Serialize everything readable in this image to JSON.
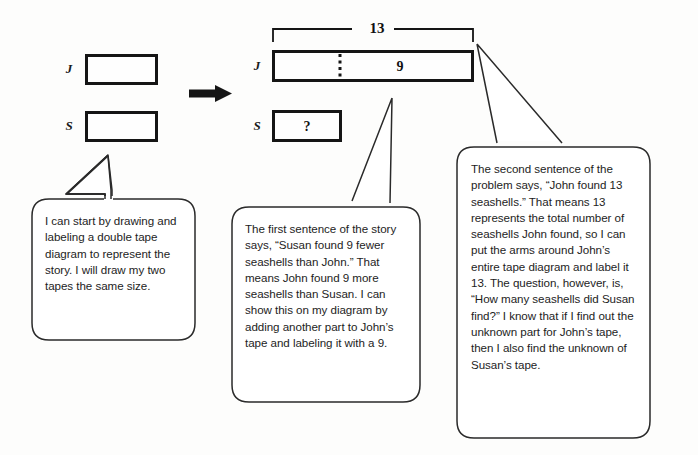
{
  "diagram": {
    "left_model": {
      "label_j": "J",
      "label_s": "S",
      "j_value": "",
      "s_value": ""
    },
    "transition_arrow": "arrow-right",
    "right_model": {
      "label_j": "J",
      "label_s": "S",
      "bracket_total": "13",
      "j_part_value": "9",
      "s_value": "?"
    },
    "bubbles": [
      {
        "id": "bubble-drawing-tapes",
        "text": "I can start by drawing and labeling a double tape diagram to represent the story.  I will draw my two tapes the same size."
      },
      {
        "id": "bubble-first-sentence",
        "text": "The first sentence of the story says, “Susan found 9 fewer seashells than John.”  That means John found 9 more seashells than Susan.  I can show this on my diagram by adding another part to John’s tape and labeling it with a 9."
      },
      {
        "id": "bubble-second-sentence",
        "text": "The second sentence of the problem says, “John found 13 seashells.”  That means 13 represents the total number of seashells John found, so I can put the arms around John’s entire tape diagram and label it 13.  The question, however, is, “How many seashells did Susan find?”  I know that if I find out the unknown part for John’s tape, then I also find the unknown of Susan’s tape."
      }
    ],
    "colors": {
      "ink": "#151515",
      "text": "#1d1d1d",
      "paper": "#fdfdfc"
    }
  }
}
